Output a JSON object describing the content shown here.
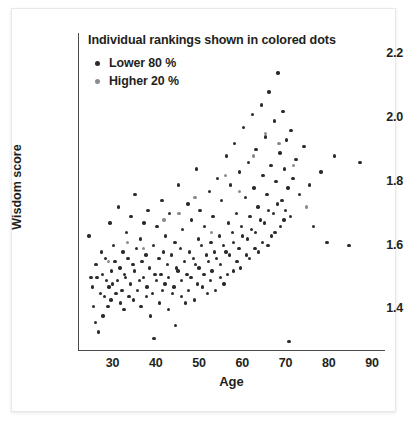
{
  "chart_data": {
    "type": "scatter",
    "title": "Individual rankings shown in colored dots",
    "xlabel": "Age",
    "ylabel": "Wisdom score",
    "xlim": [
      22,
      93
    ],
    "ylim": [
      1.27,
      2.24
    ],
    "xticks": [
      30,
      40,
      50,
      60,
      70,
      80,
      90
    ],
    "yticks": [
      "1.4",
      "1.6",
      "1.8",
      "2.0",
      "2.2"
    ],
    "ytick_values": [
      1.4,
      1.6,
      1.8,
      2.0,
      2.2
    ],
    "grid": false,
    "legend_position": "top-left",
    "series": [
      {
        "name": "Lower 80 %",
        "color": "#2b2b2b",
        "points": [
          [
            24.5,
            1.63
          ],
          [
            25.0,
            1.5
          ],
          [
            25.4,
            1.47
          ],
          [
            25.6,
            1.41
          ],
          [
            26.2,
            1.54
          ],
          [
            26.4,
            1.5
          ],
          [
            26.0,
            1.36
          ],
          [
            26.8,
            1.33
          ],
          [
            27.4,
            1.58
          ],
          [
            27.6,
            1.51
          ],
          [
            27.2,
            1.45
          ],
          [
            27.8,
            1.38
          ],
          [
            28.3,
            1.56
          ],
          [
            28.6,
            1.49
          ],
          [
            28.1,
            1.44
          ],
          [
            28.9,
            1.41
          ],
          [
            29.4,
            1.67
          ],
          [
            29.8,
            1.52
          ],
          [
            29.2,
            1.47
          ],
          [
            29.6,
            1.43
          ],
          [
            30.2,
            1.6
          ],
          [
            30.6,
            1.55
          ],
          [
            30.0,
            1.48
          ],
          [
            30.8,
            1.45
          ],
          [
            31.3,
            1.72
          ],
          [
            31.7,
            1.53
          ],
          [
            31.1,
            1.49
          ],
          [
            31.9,
            1.42
          ],
          [
            32.4,
            1.58
          ],
          [
            32.8,
            1.51
          ],
          [
            32.2,
            1.46
          ],
          [
            32.6,
            1.4
          ],
          [
            33.2,
            1.64
          ],
          [
            33.6,
            1.56
          ],
          [
            33.0,
            1.5
          ],
          [
            33.8,
            1.44
          ],
          [
            34.3,
            1.69
          ],
          [
            34.7,
            1.54
          ],
          [
            34.1,
            1.48
          ],
          [
            34.9,
            1.43
          ],
          [
            35.2,
            1.76
          ],
          [
            35.6,
            1.59
          ],
          [
            35.0,
            1.52
          ],
          [
            35.8,
            1.46
          ],
          [
            36.4,
            1.62
          ],
          [
            36.8,
            1.55
          ],
          [
            36.2,
            1.49
          ],
          [
            36.6,
            1.41
          ],
          [
            37.3,
            1.67
          ],
          [
            37.7,
            1.57
          ],
          [
            37.1,
            1.5
          ],
          [
            37.9,
            1.44
          ],
          [
            38.2,
            1.71
          ],
          [
            38.6,
            1.53
          ],
          [
            38.0,
            1.47
          ],
          [
            38.8,
            1.38
          ],
          [
            39.4,
            1.6
          ],
          [
            39.8,
            1.51
          ],
          [
            39.2,
            1.45
          ],
          [
            39.6,
            1.31
          ],
          [
            40.3,
            1.66
          ],
          [
            40.7,
            1.56
          ],
          [
            40.1,
            1.49
          ],
          [
            40.9,
            1.42
          ],
          [
            41.4,
            1.74
          ],
          [
            41.8,
            1.58
          ],
          [
            41.2,
            1.51
          ],
          [
            41.6,
            1.46
          ],
          [
            42.3,
            1.63
          ],
          [
            42.7,
            1.54
          ],
          [
            42.1,
            1.48
          ],
          [
            42.9,
            1.4
          ],
          [
            43.2,
            1.7
          ],
          [
            43.6,
            1.57
          ],
          [
            43.0,
            1.5
          ],
          [
            43.8,
            1.45
          ],
          [
            44.4,
            1.61
          ],
          [
            44.8,
            1.53
          ],
          [
            44.2,
            1.47
          ],
          [
            44.6,
            1.35
          ],
          [
            45.3,
            1.79
          ],
          [
            45.7,
            1.59
          ],
          [
            45.1,
            1.52
          ],
          [
            45.9,
            1.44
          ],
          [
            46.2,
            1.65
          ],
          [
            46.6,
            1.55
          ],
          [
            46.0,
            1.49
          ],
          [
            46.8,
            1.42
          ],
          [
            47.4,
            1.73
          ],
          [
            47.8,
            1.58
          ],
          [
            47.2,
            1.51
          ],
          [
            47.6,
            1.46
          ],
          [
            48.3,
            1.68
          ],
          [
            48.7,
            1.56
          ],
          [
            48.1,
            1.5
          ],
          [
            48.9,
            1.43
          ],
          [
            49.4,
            1.84
          ],
          [
            49.8,
            1.62
          ],
          [
            49.2,
            1.54
          ],
          [
            49.6,
            1.48
          ],
          [
            50.2,
            1.71
          ],
          [
            50.6,
            1.6
          ],
          [
            50.0,
            1.53
          ],
          [
            50.8,
            1.47
          ],
          [
            51.3,
            1.66
          ],
          [
            51.7,
            1.57
          ],
          [
            51.1,
            1.51
          ],
          [
            51.9,
            1.45
          ],
          [
            52.4,
            1.77
          ],
          [
            52.8,
            1.61
          ],
          [
            52.2,
            1.55
          ],
          [
            52.6,
            1.49
          ],
          [
            53.2,
            1.69
          ],
          [
            53.6,
            1.58
          ],
          [
            53.0,
            1.52
          ],
          [
            53.8,
            1.46
          ],
          [
            54.3,
            1.81
          ],
          [
            54.7,
            1.63
          ],
          [
            54.1,
            1.56
          ],
          [
            54.9,
            1.5
          ],
          [
            55.2,
            1.74
          ],
          [
            55.6,
            1.6
          ],
          [
            55.0,
            1.54
          ],
          [
            55.8,
            1.48
          ],
          [
            56.4,
            1.88
          ],
          [
            56.8,
            1.67
          ],
          [
            56.2,
            1.58
          ],
          [
            56.6,
            1.51
          ],
          [
            57.3,
            1.79
          ],
          [
            57.7,
            1.64
          ],
          [
            57.1,
            1.57
          ],
          [
            57.9,
            1.52
          ],
          [
            58.2,
            1.92
          ],
          [
            58.6,
            1.7
          ],
          [
            58.0,
            1.61
          ],
          [
            58.8,
            1.55
          ],
          [
            59.4,
            1.83
          ],
          [
            59.8,
            1.66
          ],
          [
            59.2,
            1.59
          ],
          [
            59.6,
            1.53
          ],
          [
            60.3,
            1.97
          ],
          [
            60.7,
            1.75
          ],
          [
            60.1,
            1.63
          ],
          [
            60.9,
            1.57
          ],
          [
            61.4,
            1.86
          ],
          [
            61.8,
            1.69
          ],
          [
            61.2,
            1.62
          ],
          [
            61.6,
            1.56
          ],
          [
            62.3,
            2.01
          ],
          [
            62.7,
            1.78
          ],
          [
            62.1,
            1.65
          ],
          [
            62.9,
            1.59
          ],
          [
            63.2,
            1.9
          ],
          [
            63.6,
            1.72
          ],
          [
            63.0,
            1.64
          ],
          [
            63.8,
            1.58
          ],
          [
            64.4,
            2.04
          ],
          [
            64.8,
            1.82
          ],
          [
            64.2,
            1.68
          ],
          [
            64.6,
            1.61
          ],
          [
            65.3,
            1.94
          ],
          [
            65.7,
            1.76
          ],
          [
            65.1,
            1.67
          ],
          [
            65.9,
            1.6
          ],
          [
            66.2,
            2.08
          ],
          [
            66.6,
            1.85
          ],
          [
            66.0,
            1.71
          ],
          [
            66.8,
            1.63
          ],
          [
            67.4,
            1.99
          ],
          [
            67.8,
            1.8
          ],
          [
            67.2,
            1.7
          ],
          [
            67.6,
            1.64
          ],
          [
            68.3,
            2.14
          ],
          [
            68.7,
            1.89
          ],
          [
            68.1,
            1.73
          ],
          [
            68.9,
            1.66
          ],
          [
            69.4,
            2.02
          ],
          [
            69.8,
            1.84
          ],
          [
            69.2,
            1.74
          ],
          [
            69.6,
            1.68
          ],
          [
            70.2,
            1.93
          ],
          [
            70.6,
            1.78
          ],
          [
            70.0,
            1.71
          ],
          [
            70.8,
            1.3
          ],
          [
            71.3,
            1.96
          ],
          [
            71.7,
            1.81
          ],
          [
            71.1,
            1.69
          ],
          [
            72.4,
            1.87
          ],
          [
            73.2,
            1.76
          ],
          [
            74.3,
            1.91
          ],
          [
            75.6,
            1.79
          ],
          [
            76.4,
            1.66
          ],
          [
            78.2,
            1.83
          ],
          [
            79.6,
            1.61
          ],
          [
            81.3,
            1.88
          ],
          [
            84.7,
            1.6
          ],
          [
            87.2,
            1.86
          ]
        ]
      },
      {
        "name": "Higher 20 %",
        "color": "#8c8c8c",
        "points": [
          [
            29.1,
            1.55
          ],
          [
            33.5,
            1.61
          ],
          [
            37.2,
            1.59
          ],
          [
            41.9,
            1.68
          ],
          [
            45.4,
            1.7
          ],
          [
            49.1,
            1.75
          ],
          [
            52.9,
            1.64
          ],
          [
            56.1,
            1.82
          ],
          [
            59.3,
            1.77
          ],
          [
            62.6,
            1.88
          ],
          [
            65.4,
            1.95
          ],
          [
            68.5,
            1.92
          ],
          [
            71.9,
            1.85
          ],
          [
            74.8,
            1.72
          ]
        ]
      }
    ]
  },
  "axes": {
    "x_pixel_map": {
      "22": 78,
      "93": 385
    },
    "y_pixel_map": {
      "1.27": 351,
      "2.24": 41
    }
  }
}
